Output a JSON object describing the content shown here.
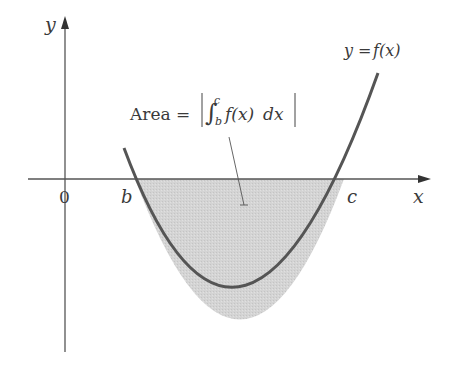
{
  "diagram": {
    "axes": {
      "x_label": "x",
      "y_label": "y",
      "origin_label": "0"
    },
    "curve": {
      "label": "y = f(x)",
      "label_y": "y",
      "label_eq": "=",
      "label_fx": "f(x)",
      "color": "#555555"
    },
    "points": {
      "b_label": "b",
      "c_label": "c"
    },
    "region": {
      "fill": "#d3d3d3",
      "description": "shaded region between curve and x-axis from b to c"
    },
    "annotation": {
      "prefix": "Area =",
      "integral_sign": "∫",
      "upper_limit": "c",
      "lower_limit": "b",
      "integrand": "f(x)",
      "differential": "dx",
      "abs_bar": "|"
    }
  }
}
